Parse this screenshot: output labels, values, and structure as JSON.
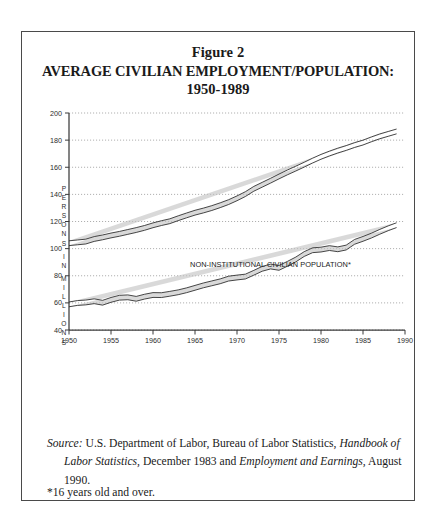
{
  "figure": {
    "title_line_1": "Figure 2",
    "title_line_2": "AVERAGE CIVILIAN EMPLOYMENT/POPULATION:",
    "title_line_3": "1950-1989",
    "y_axis_title_letters": [
      "P",
      "E",
      "R",
      "S",
      "O",
      "N",
      "S",
      "",
      "I",
      "N",
      "",
      "M",
      "I",
      "L",
      "L",
      "I",
      "O",
      "N",
      "S"
    ],
    "source_label": "Source:",
    "source_text_1": " U.S. Department of Labor, Bureau of Labor Statistics, ",
    "source_italic_1": "Handbook of Labor Statistics,",
    "source_text_2": " December 1983 and ",
    "source_italic_2": "Employment and Earnings,",
    "source_text_3": " August 1990.",
    "footnote": "*16 years old and over."
  },
  "chart_data": {
    "type": "line",
    "title": "AVERAGE CIVILIAN EMPLOYMENT/POPULATION: 1950-1989",
    "xlabel": "",
    "ylabel": "PERSONS IN MILLIONS",
    "xlim": [
      1950,
      1990
    ],
    "ylim": [
      40,
      200
    ],
    "xticks": [
      1950,
      1955,
      1960,
      1965,
      1970,
      1975,
      1980,
      1985,
      1990
    ],
    "yticks": [
      40,
      60,
      80,
      100,
      120,
      140,
      160,
      180,
      200
    ],
    "grid": true,
    "legend_position": "inline-annotation",
    "x": [
      1950,
      1951,
      1952,
      1953,
      1954,
      1955,
      1956,
      1957,
      1958,
      1959,
      1960,
      1961,
      1962,
      1963,
      1964,
      1965,
      1966,
      1967,
      1968,
      1969,
      1970,
      1971,
      1972,
      1973,
      1974,
      1975,
      1976,
      1977,
      1978,
      1979,
      1980,
      1981,
      1982,
      1983,
      1984,
      1985,
      1986,
      1987,
      1988,
      1989
    ],
    "series": [
      {
        "name": "NON-INSTITUTIONAL CIVILIAN POPULATION*",
        "annotation": "NON-INSTITUTIONAL CIVILIAN POPULATION*",
        "values": [
          104.0,
          104.6,
          105.2,
          107.1,
          108.3,
          109.7,
          110.9,
          112.3,
          113.7,
          115.3,
          117.2,
          118.8,
          120.2,
          122.4,
          124.5,
          126.5,
          128.1,
          129.9,
          132.0,
          134.3,
          137.1,
          140.2,
          144.1,
          147.1,
          150.1,
          153.2,
          156.2,
          159.0,
          161.9,
          164.9,
          167.7,
          170.1,
          172.3,
          174.2,
          176.4,
          178.2,
          180.6,
          182.8,
          184.6,
          186.4
        ]
      },
      {
        "name": "CIVILIAN EMPLOYMENT*",
        "annotation": "CIVILIAN EMPLOYMENT*",
        "values": [
          58.9,
          59.9,
          60.3,
          61.2,
          60.1,
          62.2,
          63.8,
          64.1,
          63.0,
          64.6,
          65.8,
          65.7,
          66.7,
          67.8,
          69.3,
          71.1,
          72.9,
          74.4,
          75.9,
          77.9,
          78.7,
          79.4,
          82.2,
          85.1,
          86.8,
          85.8,
          88.8,
          92.0,
          96.0,
          98.8,
          99.3,
          100.4,
          99.5,
          100.8,
          105.0,
          107.2,
          109.6,
          112.4,
          115.0,
          117.3
        ]
      }
    ]
  }
}
